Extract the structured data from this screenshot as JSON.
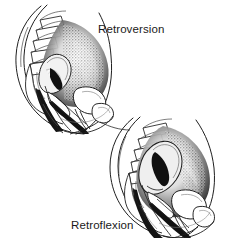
{
  "figure": {
    "type": "medical-illustration",
    "style": "pen-and-ink line drawing with stipple and crosshatch shading",
    "palette": {
      "background": "#ffffff",
      "ink": "#1a1a1a",
      "mid_tone": "#6e6e6e",
      "light_tone": "#c9c9c9"
    },
    "panels": [
      {
        "id": "retroversion",
        "label": "Retroversion",
        "label_position": {
          "x": 98,
          "y": 23
        },
        "view": "midsagittal section of the female pelvis",
        "structures": [
          "lumbar vertebrae",
          "sacrum",
          "coccyx",
          "uterus (tilted backward as a whole)",
          "cervix",
          "vagina",
          "urinary bladder",
          "pubic symphysis",
          "rectum",
          "anal canal",
          "abdominal wall"
        ]
      },
      {
        "id": "retroflexion",
        "label": "Retroflexion",
        "label_position": {
          "x": 71,
          "y": 219
        },
        "view": "midsagittal section of the female pelvis",
        "structures": [
          "lumbar vertebrae",
          "sacrum",
          "coccyx",
          "uterus (body bent backward on the cervix)",
          "cervix",
          "vagina",
          "urinary bladder",
          "pubic symphysis",
          "rectum",
          "anal canal",
          "abdominal wall"
        ]
      }
    ]
  }
}
